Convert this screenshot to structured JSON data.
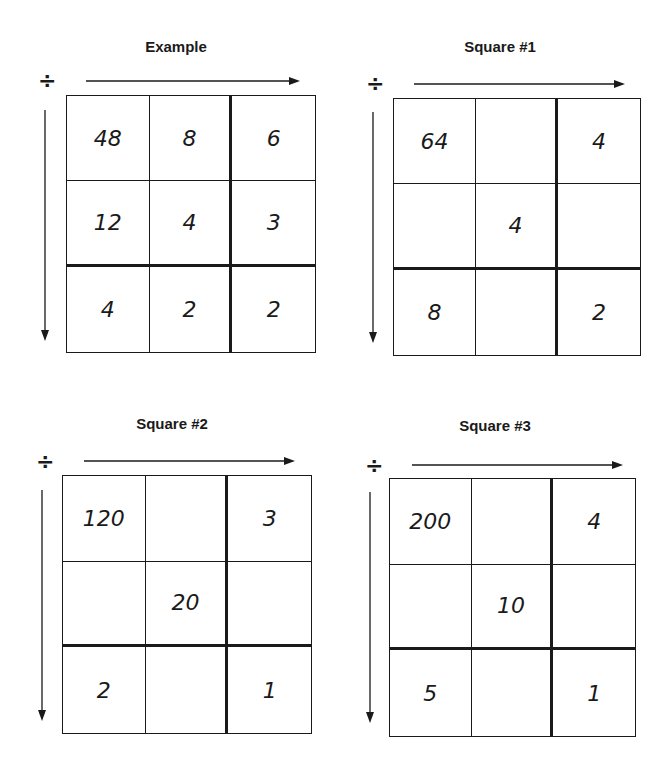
{
  "operation_symbol": "÷",
  "puzzles": [
    {
      "title": "Example",
      "cells": [
        [
          "48",
          "8",
          "6"
        ],
        [
          "12",
          "4",
          "3"
        ],
        [
          "4",
          "2",
          "2"
        ]
      ]
    },
    {
      "title": "Square #1",
      "cells": [
        [
          "64",
          "",
          "4"
        ],
        [
          "",
          "4",
          ""
        ],
        [
          "8",
          "",
          "2"
        ]
      ]
    },
    {
      "title": "Square #2",
      "cells": [
        [
          "120",
          "",
          "3"
        ],
        [
          "",
          "20",
          ""
        ],
        [
          "2",
          "",
          "1"
        ]
      ]
    },
    {
      "title": "Square #3",
      "cells": [
        [
          "200",
          "",
          "4"
        ],
        [
          "",
          "10",
          ""
        ],
        [
          "5",
          "",
          "1"
        ]
      ]
    }
  ]
}
